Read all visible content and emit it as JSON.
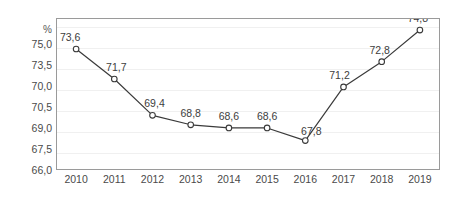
{
  "chart_data": {
    "type": "line",
    "title": "",
    "subtitle": "",
    "xlabel": "",
    "ylabel": "%",
    "unit": "%",
    "grid": true,
    "legend": false,
    "legend_position": "none",
    "categories": [
      "2010",
      "2011",
      "2012",
      "2013",
      "2014",
      "2015",
      "2016",
      "2017",
      "2018",
      "2019"
    ],
    "values": [
      73.6,
      71.7,
      69.4,
      68.8,
      68.6,
      68.6,
      67.8,
      71.2,
      72.8,
      74.8
    ],
    "point_labels": [
      "73,6",
      "71,7",
      "69,4",
      "68,8",
      "68,6",
      "68,6",
      "67,8",
      "71,2",
      "72,8",
      "74,8"
    ],
    "ylim": [
      66.0,
      75.5
    ],
    "y_tick_labels": [
      "75,0",
      "73,5",
      "70,0",
      "70,5",
      "69,0",
      "67,5",
      "66,0"
    ],
    "series_name": "",
    "line_color": "#3a3a3a",
    "marker_fill": "#ffffff",
    "marker_edge": "#3a3a3a",
    "frame_color": "#9a9a9a",
    "grid_color": "#f0f0f0",
    "text_color": "#4a4a4a"
  }
}
